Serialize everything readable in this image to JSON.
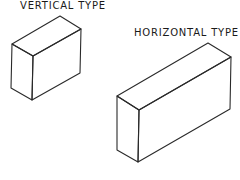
{
  "labels": {
    "vertical": "VERTICAL TYPE",
    "horizontal": "HORIZONTAL TYPE"
  },
  "colors": {
    "line": "#2a2a2a",
    "background": "#ffffff"
  }
}
